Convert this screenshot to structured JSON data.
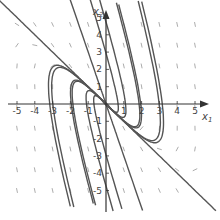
{
  "diagram": {
    "type": "phase-portrait",
    "axes": {
      "x_label": "x",
      "x_label_sub": "1",
      "y_label": "x",
      "y_label_sub": "2",
      "x_range": [
        -5,
        5
      ],
      "y_range": [
        -5,
        5
      ],
      "x_ticks": [
        "-5",
        "-4",
        "-3",
        "-2",
        "-1",
        "1",
        "2",
        "3",
        "4",
        "5"
      ],
      "y_ticks": [
        "5",
        "4",
        "3",
        "2",
        "1",
        "-1",
        "-2",
        "-3",
        "-4",
        "-5"
      ]
    },
    "colors": {
      "trajectory": "#555555",
      "axis": "#333333",
      "field": "#888888"
    }
  }
}
